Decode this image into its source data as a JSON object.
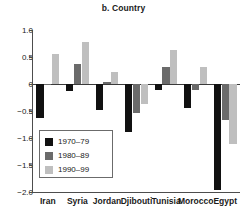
{
  "chart_data": {
    "type": "bar",
    "title": "b. Country",
    "xlabel": "",
    "ylabel": "",
    "ylim": [
      -2.0,
      1.0
    ],
    "yticks": [
      1.0,
      0.5,
      0,
      -0.5,
      -1.0,
      -1.5,
      -2.0
    ],
    "ytick_labels": [
      "1.0",
      "0.5",
      "0",
      "−0.5",
      "−1.0",
      "−1.5",
      "−2.0"
    ],
    "grid": false,
    "legend_position": "lower-left-inside",
    "categories": [
      "Iran",
      "Syria",
      "Jordan",
      "Djibouti",
      "Tunisia",
      "Morocco",
      "Egypt"
    ],
    "series": [
      {
        "name": "1970–79",
        "color": "#111111",
        "values": [
          -0.63,
          -0.13,
          -0.49,
          -0.88,
          -0.11,
          -0.45,
          -1.96
        ]
      },
      {
        "name": "1980–89",
        "color": "#6b6b6b",
        "values": [
          -0.01,
          0.37,
          0.04,
          -0.53,
          0.31,
          -0.11,
          -0.67
        ]
      },
      {
        "name": "1990–99",
        "color": "#bfbfbf",
        "values": [
          0.56,
          0.77,
          0.23,
          -0.37,
          0.63,
          0.32,
          -1.11
        ]
      }
    ]
  }
}
